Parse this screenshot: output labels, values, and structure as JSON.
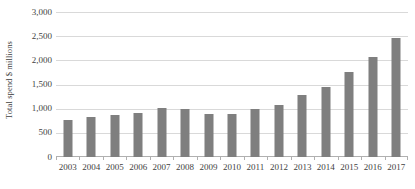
{
  "chart_data": {
    "type": "bar",
    "title": "",
    "subtitle": "",
    "xlabel": "",
    "ylabel": "Total spend $ millions",
    "categories": [
      "2003",
      "2004",
      "2005",
      "2006",
      "2007",
      "2008",
      "2009",
      "2010",
      "2011",
      "2012",
      "2013",
      "2014",
      "2015",
      "2016",
      "2017"
    ],
    "values": [
      775,
      830,
      875,
      910,
      1020,
      995,
      890,
      885,
      990,
      1075,
      1290,
      1445,
      1750,
      2065,
      2470
    ],
    "ylim": [
      0,
      3000
    ],
    "y_ticks": [
      0,
      500,
      1000,
      1500,
      2000,
      2500,
      3000
    ],
    "y_tick_labels": [
      "0",
      "500",
      "1,000",
      "1,500",
      "2,000",
      "2,500",
      "3,000"
    ],
    "grid": true,
    "legend": false,
    "legend_position": "none",
    "series": [
      {
        "name": "Total spend",
        "color": "#7f7f7f",
        "values": [
          775,
          830,
          875,
          910,
          1020,
          995,
          890,
          885,
          990,
          1075,
          1290,
          1445,
          1750,
          2065,
          2470
        ]
      }
    ],
    "colors": {
      "bar": "#7f7f7f",
      "gridline": "#d9d9d9",
      "axis": "#b0b0b0",
      "text": "#3f3f3f",
      "background": "#ffffff"
    }
  }
}
